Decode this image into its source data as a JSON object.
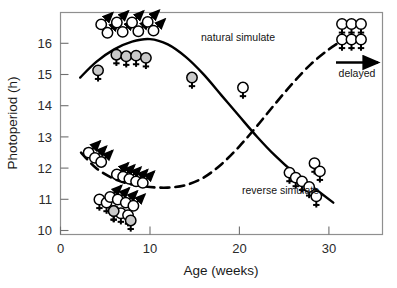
{
  "chart_data": {
    "type": "line",
    "title": "",
    "xlabel": "Age (weeks)",
    "ylabel": "Photoperiod (h)",
    "xlim": [
      0,
      36
    ],
    "ylim": [
      9.6,
      16.7
    ],
    "xticks": [
      0,
      10,
      20,
      30
    ],
    "yticks": [
      10,
      11,
      12,
      13,
      14,
      15,
      16
    ],
    "grid": false,
    "legend_position": "inline-annotations",
    "series": [
      {
        "name": "natural simulate",
        "style": "solid",
        "color": "#000000",
        "label": "natural simulate",
        "label_x": 15.8,
        "label_y": 16.05,
        "points": [
          {
            "x": 2.2,
            "y": 14.62
          },
          {
            "x": 4.0,
            "y": 15.12
          },
          {
            "x": 6.0,
            "y": 15.52
          },
          {
            "x": 8.0,
            "y": 15.77
          },
          {
            "x": 10.0,
            "y": 15.85
          },
          {
            "x": 12.0,
            "y": 15.68
          },
          {
            "x": 14.0,
            "y": 15.28
          },
          {
            "x": 16.0,
            "y": 14.72
          },
          {
            "x": 18.0,
            "y": 14.05
          },
          {
            "x": 20.0,
            "y": 13.38
          },
          {
            "x": 22.0,
            "y": 12.72
          },
          {
            "x": 24.0,
            "y": 12.12
          },
          {
            "x": 26.0,
            "y": 11.6
          },
          {
            "x": 28.0,
            "y": 11.16
          },
          {
            "x": 30.5,
            "y": 10.62
          }
        ]
      },
      {
        "name": "reverse simulate",
        "style": "dashed",
        "color": "#000000",
        "label": "reverse simulate",
        "label_x": 20.2,
        "label_y": 10.93,
        "points": [
          {
            "x": 2.3,
            "y": 12.22
          },
          {
            "x": 4.0,
            "y": 11.72
          },
          {
            "x": 6.0,
            "y": 11.38
          },
          {
            "x": 8.0,
            "y": 11.2
          },
          {
            "x": 10.0,
            "y": 11.12
          },
          {
            "x": 12.0,
            "y": 11.1
          },
          {
            "x": 14.0,
            "y": 11.18
          },
          {
            "x": 16.0,
            "y": 11.42
          },
          {
            "x": 18.0,
            "y": 11.85
          },
          {
            "x": 20.0,
            "y": 12.42
          },
          {
            "x": 22.0,
            "y": 13.08
          },
          {
            "x": 24.0,
            "y": 13.78
          },
          {
            "x": 26.0,
            "y": 14.45
          },
          {
            "x": 28.0,
            "y": 15.05
          },
          {
            "x": 30.0,
            "y": 15.52
          },
          {
            "x": 31.6,
            "y": 15.82
          }
        ]
      }
    ],
    "markers": {
      "male_symbol": "circle-with-arrow",
      "female_symbol": "circle-with-cross",
      "marker_groups": [
        {
          "group": "natural-upper-male-cluster",
          "sex": "male",
          "fill": "white",
          "points": [
            {
              "x": 4.55,
              "y": 16.32
            },
            {
              "x": 5.25,
              "y": 16.05
            },
            {
              "x": 6.3,
              "y": 16.38
            },
            {
              "x": 6.95,
              "y": 16.08
            },
            {
              "x": 8.0,
              "y": 16.38
            },
            {
              "x": 8.7,
              "y": 16.1
            },
            {
              "x": 9.75,
              "y": 16.4
            },
            {
              "x": 10.4,
              "y": 16.12
            }
          ]
        },
        {
          "group": "natural-upper-female-row",
          "sex": "female",
          "fill": "grey",
          "points": [
            {
              "x": 4.2,
              "y": 14.85
            },
            {
              "x": 6.25,
              "y": 15.35
            },
            {
              "x": 7.35,
              "y": 15.3
            },
            {
              "x": 8.45,
              "y": 15.32
            },
            {
              "x": 9.55,
              "y": 15.25
            }
          ]
        },
        {
          "group": "natural-mid-female",
          "sex": "female",
          "fill": "grey",
          "points": [
            {
              "x": 14.7,
              "y": 14.62
            }
          ]
        },
        {
          "group": "natural-mid-female-open",
          "sex": "female",
          "fill": "white",
          "points": [
            {
              "x": 20.4,
              "y": 14.3
            }
          ]
        },
        {
          "group": "natural-right-female-cluster",
          "sex": "female",
          "fill": "white",
          "points": [
            {
              "x": 25.6,
              "y": 11.58
            },
            {
              "x": 26.3,
              "y": 11.42
            },
            {
              "x": 27.0,
              "y": 11.3
            },
            {
              "x": 27.8,
              "y": 11.12
            },
            {
              "x": 28.4,
              "y": 11.88
            },
            {
              "x": 29.0,
              "y": 11.62
            },
            {
              "x": 28.6,
              "y": 10.82
            }
          ]
        },
        {
          "group": "reverse-upper-left-male",
          "sex": "male",
          "fill": "white",
          "points": [
            {
              "x": 3.15,
              "y": 12.22
            },
            {
              "x": 3.85,
              "y": 12.05
            },
            {
              "x": 4.55,
              "y": 11.92
            }
          ]
        },
        {
          "group": "reverse-mid-male-row",
          "sex": "male",
          "fill": "white",
          "points": [
            {
              "x": 6.3,
              "y": 11.52
            },
            {
              "x": 7.0,
              "y": 11.45
            },
            {
              "x": 7.7,
              "y": 11.38
            },
            {
              "x": 8.45,
              "y": 11.3
            },
            {
              "x": 9.2,
              "y": 11.25
            }
          ]
        },
        {
          "group": "reverse-lower-mixed-cluster",
          "sex": "female",
          "fill": "white",
          "points": [
            {
              "x": 4.35,
              "y": 10.72
            },
            {
              "x": 5.15,
              "y": 10.62
            },
            {
              "x": 5.95,
              "y": 10.35
            },
            {
              "x": 6.75,
              "y": 10.28
            },
            {
              "x": 7.55,
              "y": 10.22
            }
          ]
        },
        {
          "group": "reverse-lower-male-overlay",
          "sex": "male",
          "fill": "white",
          "points": [
            {
              "x": 5.55,
              "y": 10.8
            },
            {
              "x": 6.4,
              "y": 10.72
            },
            {
              "x": 7.3,
              "y": 10.62
            },
            {
              "x": 8.15,
              "y": 10.52
            }
          ]
        },
        {
          "group": "reverse-lower-grey-female",
          "sex": "female",
          "fill": "grey",
          "points": [
            {
              "x": 5.95,
              "y": 10.35
            },
            {
              "x": 7.85,
              "y": 10.05
            }
          ]
        }
      ]
    },
    "annotations": [
      {
        "name": "natural-simulate-label",
        "text": "natural simulate",
        "x": 15.8,
        "y": 16.05
      },
      {
        "name": "reverse-simulate-label",
        "text": "reverse simulate",
        "x": 20.2,
        "y": 10.93
      },
      {
        "name": "delayed-legend-label",
        "text": "delayed",
        "x": 34.1,
        "y": 14.95
      }
    ],
    "legend": {
      "name": "delayed-legend",
      "label": "delayed",
      "arrow": "right-arrow",
      "symbol_rows": 2,
      "symbols_per_row": 3,
      "symbol_type": "female"
    }
  },
  "axes": {
    "x_title": "Age (weeks)",
    "y_title": "Photoperiod (h)",
    "x_tick_labels": [
      "0",
      "10",
      "20",
      "30"
    ],
    "y_tick_labels": [
      "16",
      "15",
      "14",
      "13",
      "12",
      "11",
      "10"
    ]
  }
}
